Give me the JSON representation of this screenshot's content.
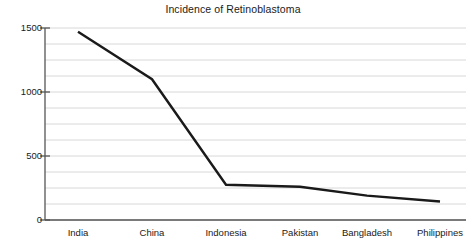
{
  "chart_data": {
    "type": "line",
    "title": "Incidence of Retinoblastoma",
    "xlabel": "",
    "ylabel": "",
    "categories": [
      "India",
      "China",
      "Indonesia",
      "Pakistan",
      "Bangladesh",
      "Philippines"
    ],
    "values": [
      1470,
      1100,
      275,
      260,
      190,
      145
    ],
    "series": [
      {
        "name": "Incidence",
        "values": [
          1470,
          1100,
          275,
          260,
          190,
          145
        ]
      }
    ],
    "ylim": [
      0,
      1500
    ],
    "y_major_ticks": [
      0,
      500,
      1000,
      1500
    ],
    "y_tick_labels": [
      "0",
      "500",
      "1000",
      "1500"
    ],
    "y_minor_gridline_step": 125,
    "grid": true,
    "grid_orientation": "horizontal",
    "legend": false,
    "legend_position": "none",
    "line_color": "#1a1a1a",
    "line_width": 2.4,
    "markers": false,
    "axis_color": "#555555",
    "grid_color": "#d8d8d8",
    "background_color": "#ffffff"
  },
  "geometry": {
    "plot_left": 45,
    "plot_right": 466,
    "plot_top": 28,
    "plot_bottom": 220,
    "category_x": [
      78,
      152,
      226,
      300,
      367,
      440
    ]
  }
}
